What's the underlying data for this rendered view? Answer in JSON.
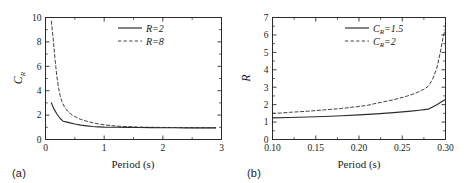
{
  "figure": {
    "background_color": "#ffffff",
    "line_color": "#2b2b2b",
    "panels": [
      {
        "label": "(a)",
        "xlabel": "Period (s)",
        "ylabel_main": "C",
        "ylabel_sub": "R"
      },
      {
        "label": "(b)",
        "xlabel": "Period (s)",
        "ylabel_main": "R",
        "ylabel_sub": ""
      }
    ]
  },
  "chart_data": [
    {
      "type": "line",
      "panel": "(a)",
      "title": "",
      "xlabel": "Period (s)",
      "ylabel": "C_R",
      "xlim": [
        0,
        3
      ],
      "ylim": [
        0,
        10
      ],
      "xticks": [
        0,
        1,
        2,
        3
      ],
      "xticklabels": [
        "0",
        "1",
        "2",
        "3"
      ],
      "yticks": [
        0,
        2,
        4,
        6,
        8,
        10
      ],
      "yticklabels": [
        "0",
        "2",
        "4",
        "6",
        "8",
        "10"
      ],
      "grid": false,
      "legend_position": "top-right",
      "series": [
        {
          "name": "R=2",
          "style": "solid",
          "x": [
            0.1,
            0.15,
            0.2,
            0.25,
            0.3,
            0.35,
            0.4,
            0.5,
            0.6,
            0.7,
            0.8,
            0.9,
            1.0,
            1.2,
            1.4,
            1.6,
            1.8,
            2.0,
            2.2,
            2.4,
            2.6,
            2.8,
            2.9
          ],
          "y": [
            3.0,
            2.45,
            2.05,
            1.72,
            1.5,
            1.44,
            1.38,
            1.27,
            1.18,
            1.12,
            1.07,
            1.04,
            1.02,
            1.0,
            0.99,
            0.98,
            0.97,
            0.96,
            0.96,
            0.95,
            0.95,
            0.95,
            0.95
          ]
        },
        {
          "name": "R=8",
          "style": "dashed",
          "x": [
            0.1,
            0.13,
            0.16,
            0.19,
            0.22,
            0.25,
            0.28,
            0.32,
            0.36,
            0.4,
            0.45,
            0.5,
            0.6,
            0.7,
            0.8,
            0.9,
            1.0,
            1.2,
            1.4,
            1.6,
            1.8,
            2.0,
            2.2,
            2.4,
            2.6,
            2.8,
            2.9
          ],
          "y": [
            9.7,
            8.3,
            6.7,
            5.3,
            4.3,
            3.6,
            3.1,
            2.7,
            2.42,
            2.22,
            2.02,
            1.88,
            1.65,
            1.5,
            1.38,
            1.28,
            1.2,
            1.1,
            1.05,
            1.02,
            1.0,
            0.99,
            0.98,
            0.97,
            0.96,
            0.96,
            0.96
          ]
        }
      ]
    },
    {
      "type": "line",
      "panel": "(b)",
      "title": "",
      "xlabel": "Period (s)",
      "ylabel": "R",
      "xlim": [
        0.1,
        0.3
      ],
      "ylim": [
        0,
        7
      ],
      "xticks": [
        0.1,
        0.15,
        0.2,
        0.25,
        0.3
      ],
      "xticklabels": [
        "0.10",
        "0.15",
        "0.20",
        "0.25",
        "0.30"
      ],
      "yticks": [
        0,
        1,
        2,
        3,
        4,
        5,
        6,
        7
      ],
      "yticklabels": [
        "0",
        "1",
        "2",
        "3",
        "4",
        "5",
        "6",
        "7"
      ],
      "grid": false,
      "legend_position": "top-right",
      "series": [
        {
          "name": "C_R=1.5",
          "style": "solid",
          "x": [
            0.1,
            0.12,
            0.14,
            0.16,
            0.18,
            0.2,
            0.22,
            0.24,
            0.26,
            0.27,
            0.28,
            0.285,
            0.29,
            0.295,
            0.3
          ],
          "y": [
            1.24,
            1.26,
            1.29,
            1.32,
            1.36,
            1.41,
            1.47,
            1.54,
            1.63,
            1.68,
            1.74,
            1.87,
            2.0,
            2.15,
            2.3
          ]
        },
        {
          "name": "C_R=2",
          "style": "dashed",
          "x": [
            0.1,
            0.11,
            0.12,
            0.14,
            0.16,
            0.18,
            0.2,
            0.21,
            0.22,
            0.24,
            0.255,
            0.265,
            0.275,
            0.28,
            0.285,
            0.29,
            0.294,
            0.297,
            0.3
          ],
          "y": [
            1.5,
            1.52,
            1.56,
            1.62,
            1.7,
            1.78,
            1.9,
            1.96,
            2.08,
            2.28,
            2.48,
            2.65,
            2.88,
            3.05,
            3.45,
            4.1,
            5.0,
            5.8,
            6.4
          ]
        }
      ]
    }
  ]
}
